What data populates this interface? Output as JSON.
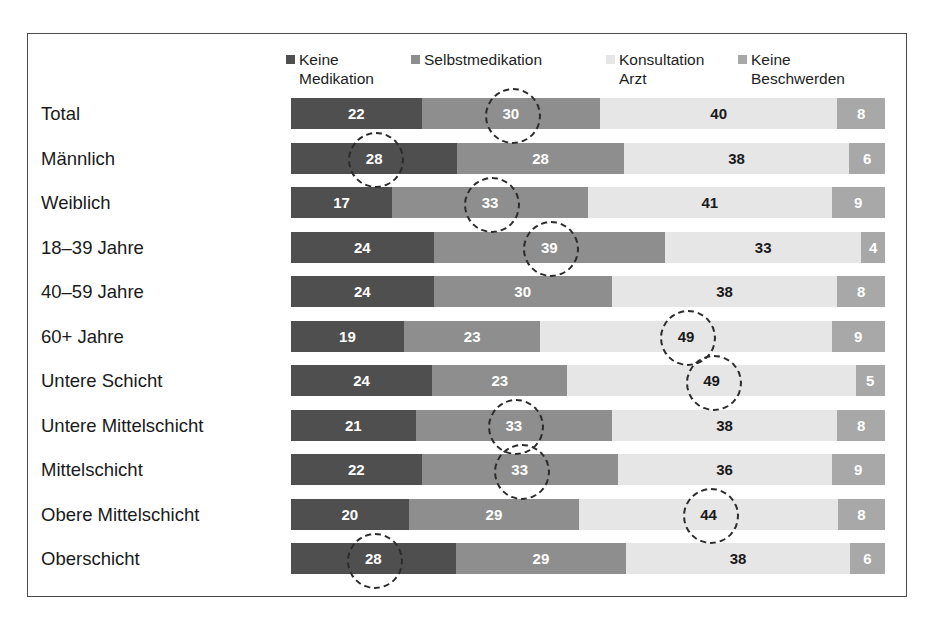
{
  "chart_data": {
    "type": "bar",
    "subtype": "stacked-horizontal-100",
    "title": "",
    "xlabel": "",
    "ylabel": "",
    "xlim": [
      0,
      100
    ],
    "grid": false,
    "legend_position": "top",
    "value_unit": "%",
    "categories": [
      "Total",
      "Männlich",
      "Weiblich",
      "18–39 Jahre",
      "40–59 Jahre",
      "60+ Jahre",
      "Untere Schicht",
      "Untere Mittelschicht",
      "Mittelschicht",
      "Obere Mittelschicht",
      "Oberschicht"
    ],
    "series": [
      {
        "name": "Keine\nMedikation",
        "color": "#4f4f4f",
        "values": [
          22,
          28,
          17,
          24,
          24,
          19,
          24,
          21,
          22,
          20,
          28
        ]
      },
      {
        "name": "Selbstmedikation",
        "color": "#8e8e8e",
        "values": [
          30,
          28,
          33,
          39,
          30,
          23,
          23,
          33,
          33,
          29,
          29
        ]
      },
      {
        "name": "Konsultation\nArzt",
        "color": "#e6e6e6",
        "values": [
          40,
          38,
          41,
          33,
          38,
          49,
          49,
          38,
          36,
          44,
          38
        ]
      },
      {
        "name": "Keine\nBeschwerden",
        "color": "#a8a8a8",
        "values": [
          8,
          6,
          9,
          4,
          8,
          9,
          5,
          8,
          9,
          8,
          6
        ]
      }
    ],
    "highlights": [
      {
        "row": 0,
        "series": 1
      },
      {
        "row": 1,
        "series": 0
      },
      {
        "row": 2,
        "series": 1
      },
      {
        "row": 3,
        "series": 1
      },
      {
        "row": 5,
        "series": 2
      },
      {
        "row": 6,
        "series": 2
      },
      {
        "row": 7,
        "series": 1
      },
      {
        "row": 8,
        "series": 1
      },
      {
        "row": 9,
        "series": 2
      },
      {
        "row": 10,
        "series": 0
      }
    ]
  },
  "legend": {
    "items": [
      {
        "label": "Keine\nMedikation",
        "color": "#4f4f4f"
      },
      {
        "label": "Selbstmedikation",
        "color": "#8e8e8e"
      },
      {
        "label": "Konsultation\nArzt",
        "color": "#e6e6e6"
      },
      {
        "label": "Keine\nBeschwerden",
        "color": "#a8a8a8"
      }
    ]
  },
  "caption": {
    "text": ""
  }
}
